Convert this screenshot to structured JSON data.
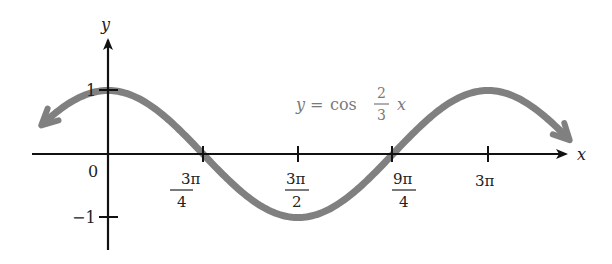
{
  "chart_data": {
    "type": "line",
    "title": "",
    "equation": {
      "lhs": "y",
      "eq": "=",
      "func": "cos",
      "num": "2",
      "den": "3",
      "var": "x"
    },
    "xlabel": "x",
    "ylabel": "y",
    "origin_label": "0",
    "y_ticks": [
      {
        "value": 1,
        "label": "1"
      },
      {
        "value": -1,
        "label": "−1"
      }
    ],
    "x_ticks": [
      {
        "value": 2.356,
        "num": "3π",
        "den": "4",
        "label": "3π/4"
      },
      {
        "value": 4.712,
        "num": "3π",
        "den": "2",
        "label": "3π/2"
      },
      {
        "value": 7.069,
        "num": "9π",
        "den": "4",
        "label": "9π/4"
      },
      {
        "value": 9.425,
        "num": "3π",
        "den": "",
        "label": "3π"
      }
    ],
    "series": [
      {
        "name": "y = cos(2/3 x)",
        "function": "cos(2x/3)",
        "color": "#808080",
        "x_range": [
          -1.6,
          11.4
        ],
        "arrows_both_ends": true,
        "key_points": [
          {
            "x": 0,
            "y": 1
          },
          {
            "x": 2.356,
            "y": 0
          },
          {
            "x": 4.712,
            "y": -1
          },
          {
            "x": 7.069,
            "y": 0
          },
          {
            "x": 9.425,
            "y": 1
          }
        ]
      }
    ],
    "xlim": [
      -2.4,
      14.6
    ],
    "ylim": [
      -1.6,
      1.7
    ],
    "grid": false,
    "legend": "none (equation annotated on curve)"
  },
  "colors": {
    "axis": "#111111",
    "curve": "#808080",
    "annotation": "#7a7a7a"
  }
}
